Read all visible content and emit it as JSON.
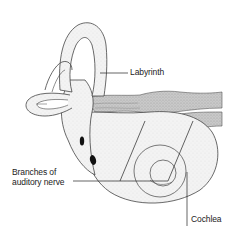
{
  "diagram": {
    "labels": {
      "labyrinth": "Labyrinth",
      "branches_line1": "Branches of",
      "branches_line2": "auditory nerve",
      "cochlea": "Cochlea"
    },
    "colors": {
      "outline": "#333333",
      "fill": "#f2f2f2",
      "nerve": "#bdbdbd",
      "text": "#222222"
    }
  }
}
